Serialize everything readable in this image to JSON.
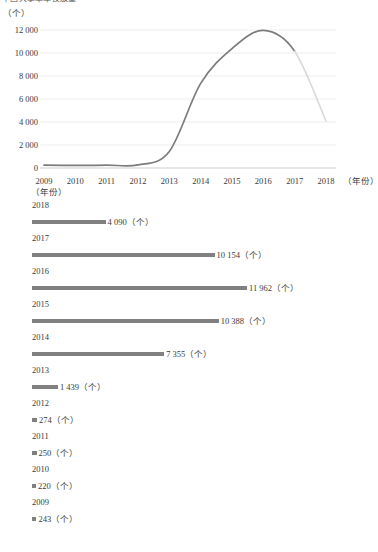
{
  "page": {
    "clipped_heading": "中国共享单车投放量"
  },
  "line_chart_section": {
    "y_unit": "（个）",
    "x_unit": "（年份）"
  },
  "bar_chart_section": {
    "unit_label": "（年份）",
    "value_suffix": "（个）"
  },
  "chart_data": [
    {
      "type": "line",
      "title": "",
      "xlabel": "（年份）",
      "ylabel": "（个）",
      "x": [
        2009,
        2010,
        2011,
        2012,
        2013,
        2014,
        2015,
        2016,
        2017,
        2018
      ],
      "xticklabels": [
        "2009",
        "2010",
        "2011",
        "2012",
        "2013",
        "2014",
        "2015",
        "2016",
        "2017",
        "2018"
      ],
      "values": [
        243,
        220,
        250,
        274,
        1439,
        7355,
        10388,
        11962,
        10154,
        4090
      ],
      "yticklabels": [
        "0",
        "2 000",
        "4 000",
        "6 000",
        "8 000",
        "10 000",
        "12 000"
      ],
      "yticks": [
        0,
        2000,
        4000,
        6000,
        8000,
        10000,
        12000
      ],
      "ylim": [
        0,
        12600
      ],
      "grid": true,
      "legend": "none",
      "line_color": "#7c7c7c",
      "faded_segment_color": "#d8d8d8",
      "faded_from_year": 2017,
      "smoothing": "spline"
    },
    {
      "type": "bar",
      "orientation": "horizontal",
      "title": "",
      "xlabel": "",
      "ylabel": "（年份）",
      "categories": [
        "2018",
        "2017",
        "2016",
        "2015",
        "2014",
        "2013",
        "2012",
        "2011",
        "2010",
        "2009"
      ],
      "values": [
        4090,
        10154,
        11962,
        10388,
        7355,
        1439,
        274,
        250,
        220,
        243
      ],
      "value_labels": [
        "4 090（个）",
        "10 154（个）",
        "11 962（个）",
        "10 388（个）",
        "7 355（个）",
        "1 439（个）",
        "274（个）",
        "250（个）",
        "220（个）",
        "243（个）"
      ],
      "bar_color": "#808080",
      "xlim": [
        0,
        11962
      ],
      "grid": false,
      "legend": "none"
    }
  ]
}
